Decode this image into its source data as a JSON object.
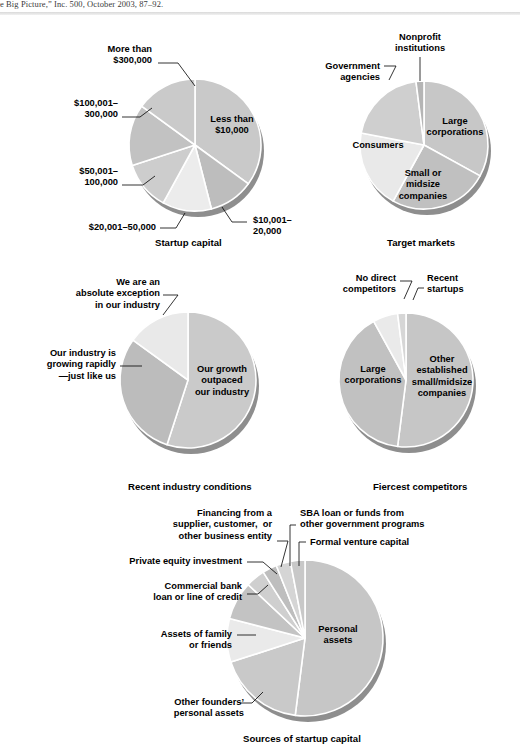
{
  "citation": {
    "text": "e Big Picture,” Inc. 500, October 2003, 87–92."
  },
  "palette": {
    "g1": "#c9c9c9",
    "g2": "#bdbdbd",
    "g3": "#d2d2d2",
    "g4": "#e8e8e8",
    "g5": "#b3b3b3",
    "g6": "#dadada",
    "light": "#ececec",
    "rim": "#8e8e8e",
    "divider": "#ffffff",
    "text": "#000000"
  },
  "chart_data": [
    {
      "id": "startup-capital",
      "type": "pie",
      "title": "Startup capital",
      "center": [
        195,
        145
      ],
      "radius": 66,
      "start_angle": 0,
      "categories": [
        "Less than $10,000",
        "$10,001–20,000",
        "$20,001–50,000",
        "$50,001–100,000",
        "$100,001–300,000",
        "More than $300,000"
      ],
      "values": [
        35,
        11,
        12,
        12,
        15,
        15
      ],
      "colors": [
        "#c9c9c9",
        "#bdbdbd",
        "#ececec",
        "#cdcdcd",
        "#c2c2c2",
        "#cacaca"
      ],
      "inner_labels": [
        {
          "text": "Less than\n$10,000",
          "x": 232,
          "y": 122
        }
      ],
      "callouts": [
        {
          "name": "more-than-300000",
          "text": "More than\n$300,000",
          "x": 62,
          "y": 44,
          "align": "r",
          "w": 90,
          "line": [
            [
              158,
              63
            ],
            [
              178,
              63
            ],
            [
              195,
              86
            ]
          ]
        },
        {
          "name": "100001-300000",
          "text": "$100,001–\n300,000",
          "x": 38,
          "y": 98,
          "align": "r",
          "w": 80,
          "line": [
            [
              122,
              117
            ],
            [
              140,
              117
            ],
            [
              152,
              108
            ]
          ]
        },
        {
          "name": "50001-100000",
          "text": "$50,001–\n100,000",
          "x": 45,
          "y": 166,
          "align": "r",
          "w": 73,
          "line": [
            [
              122,
              185
            ],
            [
              143,
              185
            ],
            [
              155,
              176
            ]
          ]
        },
        {
          "name": "20001-50000",
          "text": "$20,001–50,000",
          "x": 58,
          "y": 222,
          "align": "r",
          "w": 98,
          "line": [
            [
              160,
              228
            ],
            [
              176,
              228
            ],
            [
              185,
              213
            ]
          ]
        },
        {
          "name": "10001-20000",
          "text": "$10,001–\n20,000",
          "x": 253,
          "y": 215,
          "align": "l",
          "w": 68,
          "line": [
            [
              247,
              222
            ],
            [
              232,
              222
            ],
            [
              222,
              207
            ]
          ]
        }
      ],
      "title_pos": [
        155,
        237
      ]
    },
    {
      "id": "target-markets",
      "type": "pie",
      "title": "Target markets",
      "center": [
        424,
        145
      ],
      "radius": 64,
      "start_angle": 0,
      "categories": [
        "Large corporations",
        "Small or midsize companies",
        "Consumers",
        "Government agencies",
        "Nonprofit institutions"
      ],
      "values": [
        33,
        25,
        20,
        20,
        2
      ],
      "colors": [
        "#c7c7c7",
        "#c0c0c0",
        "#e9e9e9",
        "#cfcfcf",
        "#b5b5b5"
      ],
      "inner_labels": [
        {
          "text": "Large\ncorporations",
          "x": 455,
          "y": 124
        },
        {
          "text": "Small or\nmidsize\ncompanies",
          "x": 423,
          "y": 176
        },
        {
          "text": "Consumers",
          "x": 378,
          "y": 148
        }
      ],
      "callouts": [
        {
          "name": "nonprofit-institutions",
          "text": "Nonprofit\ninstitutions",
          "x": 378,
          "y": 32,
          "align": "c",
          "w": 84,
          "line": [
            [
              420,
              57
            ],
            [
              420,
              81
            ]
          ]
        },
        {
          "name": "government-agencies",
          "text": "Government\nagencies",
          "x": 292,
          "y": 61,
          "align": "r",
          "w": 88,
          "line": [
            [
              384,
              66
            ],
            [
              396,
              66
            ],
            [
              389,
              80
            ]
          ]
        }
      ],
      "title_pos": [
        387,
        237
      ]
    },
    {
      "id": "recent-industry-conditions",
      "type": "pie",
      "title": "Recent industry conditions",
      "center": [
        188,
        380
      ],
      "radius": 68,
      "start_angle": 0,
      "categories": [
        "Our growth outpaced our industry",
        "Our industry is growing rapidly—just like us",
        "We are an absolute exception in our industry"
      ],
      "values": [
        55,
        30,
        15
      ],
      "colors": [
        "#cacaca",
        "#bcbcbc",
        "#e9e9e9"
      ],
      "inner_labels": [
        {
          "text": "Our growth\noutpaced\nour industry",
          "x": 222,
          "y": 372
        }
      ],
      "callouts": [
        {
          "name": "absolute-exception",
          "text": "We are an\nabsolute exception\nin our industry",
          "x": 42,
          "y": 277,
          "align": "r",
          "w": 118,
          "line": [
            [
              163,
              295
            ],
            [
              178,
              295
            ],
            [
              163,
              315
            ]
          ]
        },
        {
          "name": "industry-growing-rapidly",
          "text": "Our industry is\ngrowing rapidly\n—just like us",
          "x": 16,
          "y": 348,
          "align": "r",
          "w": 100,
          "line": [
            [
              120,
              366
            ],
            [
              142,
              366
            ]
          ]
        }
      ],
      "title_pos": [
        128,
        481
      ]
    },
    {
      "id": "fiercest-competitors",
      "type": "pie",
      "title": "Fiercest competitors",
      "center": [
        406,
        380
      ],
      "radius": 67,
      "start_angle": 0,
      "categories": [
        "Other established small/midsize companies",
        "Large corporations",
        "No direct competitors",
        "Recent startups"
      ],
      "values": [
        52,
        40,
        6,
        2
      ],
      "colors": [
        "#c6c6c6",
        "#c1c1c1",
        "#eaeaea",
        "#d6d6d6"
      ],
      "inner_labels": [
        {
          "text": "Other\nestablished\nsmall/midsize\ncompanies",
          "x": 442,
          "y": 362
        },
        {
          "text": "Large\ncorporations",
          "x": 373,
          "y": 372
        }
      ],
      "callouts": [
        {
          "name": "no-direct-competitors",
          "text": "No direct\ncompetitors",
          "x": 318,
          "y": 273,
          "align": "r",
          "w": 78,
          "line": [
            [
              400,
              281
            ],
            [
              412,
              281
            ],
            [
              404,
              299
            ]
          ]
        },
        {
          "name": "recent-startups",
          "text": "Recent\nstartups",
          "x": 427,
          "y": 273,
          "align": "l",
          "w": 60,
          "line": [
            [
              424,
              288
            ],
            [
              418,
              288
            ],
            [
              413,
              300
            ]
          ]
        }
      ],
      "title_pos": [
        373,
        481
      ]
    },
    {
      "id": "sources-of-startup-capital",
      "type": "pie",
      "title": "Sources of startup capital",
      "center": [
        305,
        638
      ],
      "radius": 78,
      "start_angle": 0,
      "categories": [
        "Personal assets",
        "Other founders’ personal assets",
        "Assets of family or friends",
        "Commercial bank loan or line of credit",
        "Private equity investment",
        "Financing from a supplier, customer, or other business entity",
        "SBA loan or funds from other government programs",
        "Formal venture capital"
      ],
      "values": [
        52,
        18,
        9,
        8,
        4,
        3,
        3,
        3
      ],
      "colors": [
        "#c6c6c6",
        "#c9c9c9",
        "#eaeaea",
        "#c3c3c3",
        "#cfcfcf",
        "#bebebe",
        "#d5d5d5",
        "#c8c8c8"
      ],
      "inner_labels": [
        {
          "text": "Personal\nassets",
          "x": 338,
          "y": 632
        }
      ],
      "callouts": [
        {
          "name": "financing-from-supplier",
          "text": "Financing from a\nsupplier, customer,  or\nother business entity",
          "x": 130,
          "y": 508,
          "align": "r",
          "w": 142,
          "line": [
            [
              277,
              541
            ],
            [
              288,
              541
            ],
            [
              281,
              567
            ]
          ]
        },
        {
          "name": "private-equity-investment",
          "text": "Private equity investment",
          "x": 112,
          "y": 556,
          "align": "r",
          "w": 130,
          "line": [
            [
              247,
              562
            ],
            [
              263,
              562
            ],
            [
              277,
              574
            ]
          ]
        },
        {
          "name": "commercial-bank-loan",
          "text": "Commercial bank\nloan or line of credit",
          "x": 118,
          "y": 581,
          "align": "r",
          "w": 124,
          "line": [
            [
              247,
              594
            ],
            [
              258,
              594
            ],
            [
              268,
              585
            ]
          ]
        },
        {
          "name": "assets-of-family-or-friends",
          "text": "Assets of family\nor friends",
          "x": 122,
          "y": 629,
          "align": "r",
          "w": 110,
          "line": [
            [
              237,
              635
            ],
            [
              256,
              635
            ]
          ]
        },
        {
          "name": "other-founders-personal-assets",
          "text": "Other founders’\npersonal assets",
          "x": 138,
          "y": 697,
          "align": "r",
          "w": 106,
          "line": [
            [
              240,
              703
            ],
            [
              252,
              703
            ],
            [
              263,
              692
            ]
          ]
        },
        {
          "name": "sba-loan",
          "text": "SBA loan or funds from\nother government programs",
          "x": 300,
          "y": 508,
          "align": "l",
          "w": 160,
          "line": [
            [
              296,
              525
            ],
            [
              290,
              525
            ],
            [
              290,
              566
            ]
          ]
        },
        {
          "name": "formal-venture-capital",
          "text": "Formal venture capital",
          "x": 310,
          "y": 537,
          "align": "l",
          "w": 130,
          "line": [
            [
              306,
              542
            ],
            [
              299,
              542
            ],
            [
              299,
              566
            ]
          ]
        }
      ],
      "title_pos": [
        243,
        733
      ]
    }
  ]
}
